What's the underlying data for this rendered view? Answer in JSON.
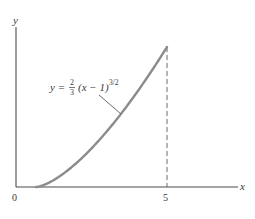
{
  "figure": {
    "axes": {
      "x_label": "x",
      "y_label": "y",
      "origin_label": "0",
      "x_tick_label": "5"
    },
    "equation_label": {
      "lhs": "y = ",
      "frac_num": "2",
      "frac_den": "3",
      "body": "(x − 1)",
      "exponent": "3/2"
    },
    "colors": {
      "axis": "#4a4a4a",
      "curve": "#8c8c8c",
      "dashed": "#6a6a6a",
      "text": "#3a3a3a"
    }
  },
  "chart_data": {
    "type": "line",
    "title": "",
    "xlabel": "x",
    "ylabel": "y",
    "function": "y = (2/3)(x - 1)^(3/2)",
    "domain": [
      1,
      5
    ],
    "x_ticks": [
      "0",
      "5"
    ],
    "x": [
      1,
      1.5,
      2,
      2.5,
      3,
      3.5,
      4,
      4.5,
      5
    ],
    "values": [
      0,
      0.236,
      0.667,
      1.225,
      1.886,
      2.635,
      3.464,
      4.365,
      5.333
    ],
    "annotations": [
      "dashed vertical line at x = 5 from the x-axis to the curve"
    ],
    "grid": false
  }
}
